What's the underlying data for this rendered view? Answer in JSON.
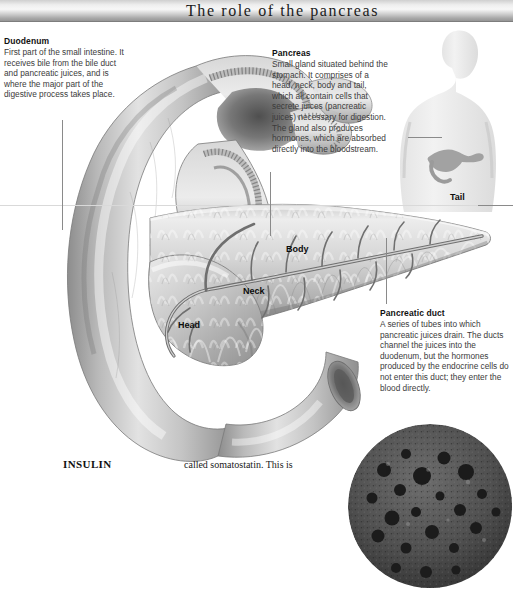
{
  "page": {
    "title": "The role of the pancreas",
    "background_color": "#ffffff",
    "banner_color": "#cfcfcf",
    "rule_color": "#d9d9d9",
    "leader_line_color": "#8a8a8a"
  },
  "callouts": {
    "duodenum": {
      "heading": "Duodenum",
      "body": "First part of the small intestine. It receives bile from the bile duct and pancreatic juices, and is where the major part of the digestive process takes place."
    },
    "pancreas": {
      "heading": "Pancreas",
      "body": "Small gland situated behind the stomach. It comprises of a head, neck, body and tail, which all contain cells that secrete juices (pancreatic juices) necessary for digestion. The gland also produces hormones, which are absorbed directly into the bloodstream."
    },
    "pancreatic_duct": {
      "heading": "Pancreatic duct",
      "body": "A series of tubes into which pancreatic juices drain. The ducts channel the juices into the duodenum, but the hormones produced by the endocrine cells do not enter this duct; they enter the blood directly."
    }
  },
  "anatomy_labels": [
    {
      "id": "tail",
      "label": "Tail"
    },
    {
      "id": "body",
      "label": "Body"
    },
    {
      "id": "neck",
      "label": "Neck"
    },
    {
      "id": "head",
      "label": "Head"
    }
  ],
  "bottom_column_text": {
    "left_heading": "INSULIN",
    "right_fragment": "called somatostatin. This is"
  },
  "illustrations": {
    "main": "pancreas-and-duodenum-illustration",
    "torso": "human-torso-pancreas-location-diagram",
    "micrograph": "pancreatic-islet-cells-micrograph"
  }
}
